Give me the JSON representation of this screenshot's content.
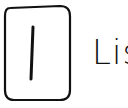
{
  "item": {
    "icon": "list-icon",
    "label": "Lis"
  },
  "colors": {
    "stroke": "#111111",
    "background": "#ffffff"
  }
}
